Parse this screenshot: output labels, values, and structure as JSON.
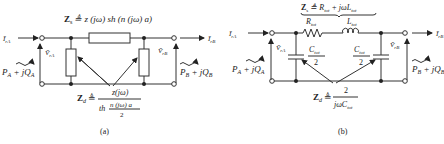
{
  "circuit_a": {
    "caption": "(a)",
    "series_impedance": {
      "lhs": "Z",
      "sub": "s",
      "def": "≜ z (jω) sh (n (jω) a)"
    },
    "shunt_impedance": {
      "lhs": "Z",
      "sub": "d",
      "def": "≜",
      "numerator": "z(jω)",
      "den_prefix": "th",
      "den_num": "n (jω) a",
      "den_den": "2"
    },
    "left": {
      "current": "Ī",
      "current_sub": "rA",
      "voltage": "V̄",
      "voltage_sub": "rA",
      "power": "P",
      "power_sub": "A",
      "power_rest": " + jQ",
      "power_rest_sub": "A"
    },
    "right": {
      "current": "Ī",
      "current_sub": "rB",
      "voltage": "V̄",
      "voltage_sub": "rB",
      "power": "P",
      "power_sub": "B",
      "power_rest": " + jQ",
      "power_rest_sub": "B"
    }
  },
  "circuit_b": {
    "caption": "(b)",
    "series_impedance": {
      "lhs": "Z",
      "sub": "s",
      "def": "≜ R",
      "def_sub": "tot",
      "def_rest": " + jωL",
      "def_rest_sub": "tot"
    },
    "resistor": {
      "label": "R",
      "sub": "tot"
    },
    "inductor": {
      "label": "L",
      "sub": "tot"
    },
    "capacitor": {
      "num": "C",
      "num_sub": "tot",
      "den": "2"
    },
    "shunt_impedance": {
      "lhs": "Z",
      "sub": "d",
      "def": "≜",
      "numerator": "2",
      "denominator": "jωC",
      "den_sub": "tot"
    },
    "left": {
      "current": "Ī",
      "current_sub": "rA",
      "voltage": "V̄",
      "voltage_sub": "rA",
      "power": "P",
      "power_sub": "A",
      "power_rest": " + jQ",
      "power_rest_sub": "A"
    },
    "right": {
      "current": "Ī",
      "current_sub": "rB",
      "voltage": "V̄",
      "voltage_sub": "rB",
      "power": "P",
      "power_sub": "B",
      "power_rest": " + jQ",
      "power_rest_sub": "B"
    }
  }
}
